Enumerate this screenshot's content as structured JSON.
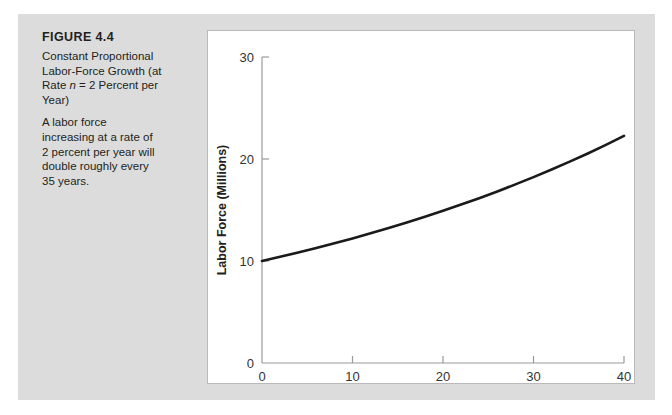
{
  "figure": {
    "number_label": "FIGURE 4.4",
    "title_line1": "Constant Proportional",
    "title_line2": "Labor-Force Growth (at",
    "title_line3_pre": "Rate ",
    "title_line3_italic": "n",
    "title_line3_post": " = 2 Percent per",
    "title_line4": "Year)",
    "note_line1": "A labor force",
    "note_line2": "increasing at a rate of",
    "note_line3": "2 percent per year will",
    "note_line4": "double roughly every",
    "note_line5": "35 years."
  },
  "colors": {
    "figure_background": "#dcdcdc",
    "panel_background": "#ffffff",
    "panel_border": "#b9b9b9",
    "axis": "#9a9a9a",
    "curve": "#1a1a1a",
    "text": "#231f20"
  },
  "chart_data": {
    "type": "line",
    "title": "",
    "xlabel": "Years after Start",
    "ylabel": "Labor Force (Millions)",
    "xlim": [
      0,
      40
    ],
    "ylim": [
      0,
      30
    ],
    "xticks": [
      0,
      10,
      20,
      30,
      40
    ],
    "xtick_labels": [
      "0",
      "10",
      "20",
      "30",
      "40"
    ],
    "yticks": [
      0,
      10,
      20,
      30
    ],
    "ytick_labels": [
      "0",
      "10",
      "20",
      "30"
    ],
    "grid": false,
    "legend": null,
    "series": [
      {
        "name": "Labor force",
        "formula": "L(t) = 10 * e^(0.02 t)",
        "x": [
          0,
          2,
          4,
          6,
          8,
          10,
          12,
          14,
          16,
          18,
          20,
          22,
          24,
          26,
          28,
          30,
          32,
          34,
          36,
          38,
          40
        ],
        "values": [
          10.0,
          10.41,
          10.83,
          11.27,
          11.73,
          12.21,
          12.71,
          13.23,
          13.77,
          14.33,
          14.92,
          15.53,
          16.16,
          16.82,
          17.51,
          18.22,
          18.97,
          19.74,
          20.54,
          21.38,
          22.26
        ]
      }
    ]
  }
}
